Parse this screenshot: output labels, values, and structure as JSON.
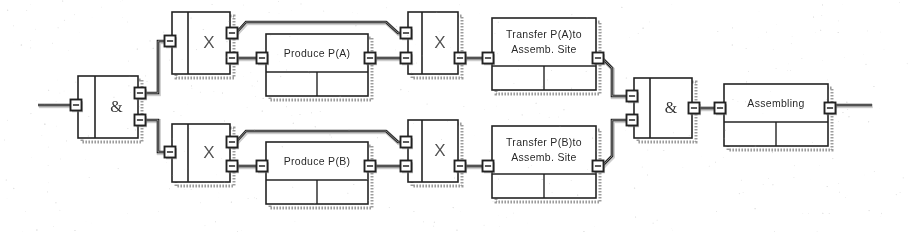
{
  "diagram": {
    "type": "function-block-diagram",
    "background_color": "#ffffff",
    "line_color": "#262626",
    "shadow_color": "#8a8a8a",
    "blocks": [
      {
        "id": "and-gate-left",
        "kind": "and-gate",
        "label": "&",
        "x": 78,
        "y": 76,
        "w": 60,
        "h": 62,
        "divider_x": 17,
        "inputs": 1,
        "outputs": 2
      },
      {
        "id": "x-transition-a1",
        "kind": "transition",
        "label": "X",
        "x": 172,
        "y": 12,
        "w": 58,
        "h": 62,
        "divider_x": 16,
        "inputs": 1,
        "outputs": 2
      },
      {
        "id": "produce-pa",
        "kind": "function-block",
        "label": "Produce P(A)",
        "x": 266,
        "y": 34,
        "w": 102,
        "h": 62,
        "header_h": 38,
        "cells": 2,
        "inputs": 1,
        "outputs": 1
      },
      {
        "id": "x-transition-a2",
        "kind": "transition",
        "label": "X",
        "x": 408,
        "y": 12,
        "w": 50,
        "h": 62,
        "divider_x": 14,
        "inputs": 2,
        "outputs": 1
      },
      {
        "id": "transfer-pa",
        "kind": "function-block",
        "label": "Transfer P(A)to",
        "label2": "Assemb. Site",
        "x": 492,
        "y": 18,
        "w": 104,
        "h": 72,
        "header_h": 48,
        "cells": 2,
        "inputs": 1,
        "outputs": 1
      },
      {
        "id": "x-transition-b1",
        "kind": "transition",
        "label": "X",
        "x": 172,
        "y": 124,
        "w": 58,
        "h": 58,
        "divider_x": 16,
        "inputs": 1,
        "outputs": 2
      },
      {
        "id": "produce-pb",
        "kind": "function-block",
        "label": "Produce P(B)",
        "x": 266,
        "y": 142,
        "w": 102,
        "h": 62,
        "header_h": 38,
        "cells": 2,
        "inputs": 1,
        "outputs": 1
      },
      {
        "id": "x-transition-b2",
        "kind": "transition",
        "label": "X",
        "x": 408,
        "y": 120,
        "w": 50,
        "h": 62,
        "divider_x": 14,
        "inputs": 2,
        "outputs": 1
      },
      {
        "id": "transfer-pb",
        "kind": "function-block",
        "label": "Transfer P(B)to",
        "label2": "Assemb. Site",
        "x": 492,
        "y": 126,
        "w": 104,
        "h": 72,
        "header_h": 48,
        "cells": 2,
        "inputs": 1,
        "outputs": 1
      },
      {
        "id": "and-gate-right",
        "kind": "and-gate",
        "label": "&",
        "x": 634,
        "y": 78,
        "w": 58,
        "h": 60,
        "divider_x": 16,
        "inputs": 2,
        "outputs": 1
      },
      {
        "id": "assembling",
        "kind": "function-block",
        "label": "Assembling",
        "x": 724,
        "y": 84,
        "w": 104,
        "h": 62,
        "header_h": 38,
        "cells": 2,
        "inputs": 1,
        "outputs": 1
      }
    ],
    "ports": [
      {
        "id": "port-input-main",
        "x": 76,
        "y": 105,
        "side": "left"
      },
      {
        "id": "port-and-left-out-a",
        "x": 140,
        "y": 93,
        "side": "right"
      },
      {
        "id": "port-and-left-out-b",
        "x": 140,
        "y": 120,
        "side": "right"
      },
      {
        "id": "port-xa1-in",
        "x": 170,
        "y": 41,
        "side": "left"
      },
      {
        "id": "port-xa1-out-top",
        "x": 232,
        "y": 33,
        "side": "right"
      },
      {
        "id": "port-xa1-out-bot",
        "x": 232,
        "y": 58,
        "side": "right"
      },
      {
        "id": "port-produce-a-in",
        "x": 262,
        "y": 58,
        "side": "left"
      },
      {
        "id": "port-produce-a-out",
        "x": 370,
        "y": 58,
        "side": "right"
      },
      {
        "id": "port-xa2-in-top",
        "x": 406,
        "y": 33,
        "side": "left"
      },
      {
        "id": "port-xa2-in-bot",
        "x": 406,
        "y": 58,
        "side": "left"
      },
      {
        "id": "port-xa2-out",
        "x": 460,
        "y": 58,
        "side": "right"
      },
      {
        "id": "port-transfer-a-in",
        "x": 488,
        "y": 58,
        "side": "left"
      },
      {
        "id": "port-transfer-a-out",
        "x": 598,
        "y": 58,
        "side": "right"
      },
      {
        "id": "port-xb1-in",
        "x": 170,
        "y": 152,
        "side": "left"
      },
      {
        "id": "port-xb1-out-top",
        "x": 232,
        "y": 142,
        "side": "right"
      },
      {
        "id": "port-xb1-out-bot",
        "x": 232,
        "y": 166,
        "side": "right"
      },
      {
        "id": "port-produce-b-in",
        "x": 262,
        "y": 166,
        "side": "left"
      },
      {
        "id": "port-produce-b-out",
        "x": 370,
        "y": 166,
        "side": "right"
      },
      {
        "id": "port-xb2-in-top",
        "x": 406,
        "y": 142,
        "side": "left"
      },
      {
        "id": "port-xb2-in-bot",
        "x": 406,
        "y": 166,
        "side": "left"
      },
      {
        "id": "port-xb2-out",
        "x": 460,
        "y": 166,
        "side": "right"
      },
      {
        "id": "port-transfer-b-in",
        "x": 488,
        "y": 166,
        "side": "left"
      },
      {
        "id": "port-transfer-b-out",
        "x": 598,
        "y": 166,
        "side": "right"
      },
      {
        "id": "port-and-right-in-a",
        "x": 632,
        "y": 96,
        "side": "left"
      },
      {
        "id": "port-and-right-in-b",
        "x": 632,
        "y": 120,
        "side": "left"
      },
      {
        "id": "port-and-right-out",
        "x": 694,
        "y": 108,
        "side": "right"
      },
      {
        "id": "port-assembling-in",
        "x": 720,
        "y": 108,
        "side": "left"
      },
      {
        "id": "port-assembling-out",
        "x": 830,
        "y": 108,
        "side": "right"
      }
    ],
    "connections": [
      {
        "id": "conn-main-input",
        "path": "M 38 105 L 74 105"
      },
      {
        "id": "conn-and-to-xa1",
        "path": "M 145 93 L 158 93 L 158 41 L 168 41"
      },
      {
        "id": "conn-and-to-xb1",
        "path": "M 145 120 L 158 120 L 158 152 L 168 152"
      },
      {
        "id": "conn-xa1-bypass",
        "path": "M 236 33 L 246 22 L 386 22 L 398 33 L 404 33"
      },
      {
        "id": "conn-xa1-to-produce-a",
        "path": "M 236 58 L 260 58"
      },
      {
        "id": "conn-produce-a-to-xa2",
        "path": "M 374 58 L 404 58"
      },
      {
        "id": "conn-xa2-to-transfer-a",
        "path": "M 464 58 L 486 58"
      },
      {
        "id": "conn-transfer-a-to-and",
        "path": "M 602 58 L 612 68 L 612 96 L 630 96"
      },
      {
        "id": "conn-xb1-bypass",
        "path": "M 236 142 L 246 131 L 386 131 L 398 142 L 404 142"
      },
      {
        "id": "conn-xb1-to-produce-b",
        "path": "M 236 166 L 260 166"
      },
      {
        "id": "conn-produce-b-to-xb2",
        "path": "M 374 166 L 404 166"
      },
      {
        "id": "conn-xb2-to-transfer-b",
        "path": "M 464 166 L 486 166"
      },
      {
        "id": "conn-transfer-b-to-and",
        "path": "M 602 166 L 612 156 L 612 120 L 630 120"
      },
      {
        "id": "conn-and-to-assembling",
        "path": "M 698 108 L 718 108"
      },
      {
        "id": "conn-main-output",
        "path": "M 834 105 L 872 105"
      }
    ]
  }
}
